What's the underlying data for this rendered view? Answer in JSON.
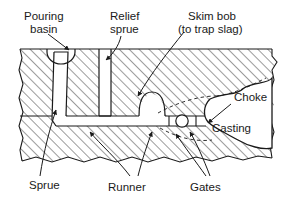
{
  "figure": {
    "type": "technical-cross-section-diagram",
    "width": 292,
    "height": 208,
    "colors": {
      "background": "#ffffff",
      "line": "#1a1a1a",
      "hatch": "#3a3a3a",
      "cavity_fill": "#ffffff",
      "text": "#1a1a1a"
    }
  },
  "labels": {
    "pouring_basin": {
      "line1": "Pouring",
      "line2": "basin"
    },
    "relief_sprue": {
      "line1": "Relief",
      "line2": "sprue"
    },
    "skim_bob": {
      "line1": "Skim bob",
      "line2": "(to trap slag)"
    },
    "choke": "Choke",
    "casting": "Casting",
    "sprue": "Sprue",
    "runner": "Runner",
    "gates": "Gates"
  },
  "features": [
    {
      "name": "pouring-basin",
      "label": "Pouring basin",
      "shape": "bowl",
      "location": "top-left"
    },
    {
      "name": "relief-sprue",
      "label": "Relief sprue",
      "shape": "narrow-vertical-channel",
      "location": "top-center-left"
    },
    {
      "name": "sprue",
      "label": "Sprue",
      "shape": "tapered-vertical-channel",
      "location": "left"
    },
    {
      "name": "runner",
      "label": "Runner",
      "shape": "horizontal-channel",
      "location": "center"
    },
    {
      "name": "skim-bob",
      "label": "Skim bob (to trap slag)",
      "shape": "dome",
      "location": "center"
    },
    {
      "name": "gates",
      "label": "Gates",
      "shape": "circular-and-narrow-openings",
      "location": "center-right"
    },
    {
      "name": "choke",
      "label": "Choke",
      "shape": "narrowed-entry",
      "location": "right"
    },
    {
      "name": "casting",
      "label": "Casting",
      "shape": "irregular-cavity",
      "location": "right"
    },
    {
      "name": "mold-material",
      "label": "Mold (sand)",
      "shape": "hatched-region",
      "location": "full"
    },
    {
      "name": "parting-line",
      "label": "Parting line",
      "shape": "horizontal-line",
      "location": "mid-left"
    }
  ]
}
